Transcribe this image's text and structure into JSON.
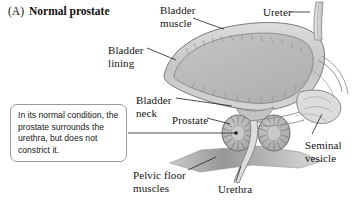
{
  "figure": {
    "panel_tag": "(A)",
    "panel_title": "Normal prostate"
  },
  "callout": {
    "text": "In its normal condition, the prostate surrounds the urethra, but does not constrict it."
  },
  "labels": {
    "bladder_muscle": "Bladder\nmuscle",
    "ureter": "Ureter",
    "bladder_lining": "Bladder\nlining",
    "bladder_neck": "Bladder\nneck",
    "prostate": "Prostate",
    "seminal_vesicle": "Seminal\nvesicle",
    "pelvic_floor_muscles": "Pelvic floor\nmuscles",
    "urethra": "Urethra"
  },
  "colors": {
    "outline": "#6f6f6f",
    "bladder_wall": "#c9c9c9",
    "bladder_lumen": "#b9b9b9",
    "prostate_fill": "#b4b4b4",
    "pelvic_floor": "#9a9a9a",
    "leader_line": "#1e1e1e",
    "callout_border": "#9a9a9a",
    "text": "#141414",
    "background": "#ffffff"
  }
}
